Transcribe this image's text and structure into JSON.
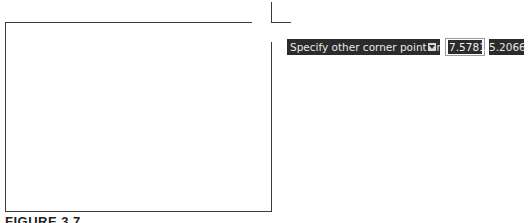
{
  "drawing": {
    "rectangle_preview": true
  },
  "dynamic_input": {
    "prompt": "Specify other corner point or",
    "options_icon": "down-arrow-icon",
    "x_value": "7.5781",
    "y_value": "5.2066"
  },
  "caption": "FIGURE 3.7"
}
